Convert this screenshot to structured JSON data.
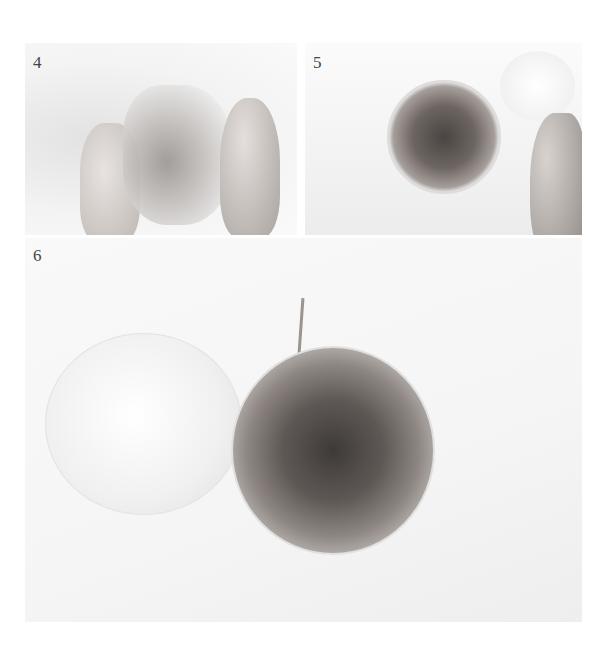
{
  "steps": [
    {
      "number": "4",
      "description": "Hands squeezing a clear plastic bag containing dried flowers"
    },
    {
      "number": "5",
      "description": "Glass bowl filled with dried flowers, hand holding a cotton-wrapped flower"
    },
    {
      "number": "6",
      "description": "Top view of glass bowl packed with dried flowers next to an inverted glass dome"
    }
  ],
  "colors": {
    "background": "#ffffff",
    "photo_bg": "#f4f4f4",
    "number_text": "#444444"
  }
}
